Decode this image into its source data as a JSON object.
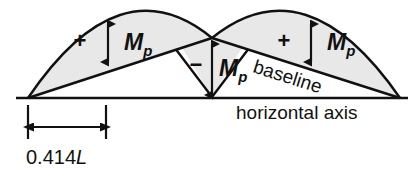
{
  "figure": {
    "type": "bending-moment-diagram",
    "colors": {
      "stroke": "#111111",
      "fill": "#e8e8e8",
      "background": "#ffffff"
    }
  },
  "labels": {
    "positive_sign_left": "+",
    "positive_sign_right": "+",
    "negative_sign_center": "−",
    "moment_symbol": "M",
    "moment_subscript": "p",
    "baseline": "baseline",
    "horizontal_axis": "horizontal axis",
    "dimension": "0.414",
    "dimension_symbol": "L"
  },
  "geometry": {
    "axis": {
      "x1": 16,
      "y1": 98,
      "x2": 408,
      "y2": 98
    },
    "left_span": {
      "start_x": 28,
      "end_x": 212,
      "peak_x": 108,
      "peak_y": 17
    },
    "right_span": {
      "start_x": 212,
      "end_x": 400,
      "peak_x": 312,
      "peak_y": 17
    },
    "baseline_left": {
      "x1": 28,
      "y1": 98,
      "x2": 212,
      "y2": 38
    },
    "baseline_right": {
      "x1": 212,
      "y1": 38,
      "x2": 400,
      "y2": 98
    },
    "center_valley_x": 212,
    "center_peak_y": 38,
    "dimension_line": {
      "x1": 28,
      "x2": 106,
      "y": 127
    },
    "extension_ticks": [
      28,
      106
    ]
  },
  "annotations": {
    "left_moment_arrow": {
      "x": 108,
      "top_y": 22,
      "bottom_y": 62
    },
    "right_moment_arrow": {
      "x": 311,
      "top_y": 22,
      "bottom_y": 62
    },
    "center_moment_arrow": {
      "x": 212,
      "top_y": 42,
      "bottom_y": 95
    }
  }
}
